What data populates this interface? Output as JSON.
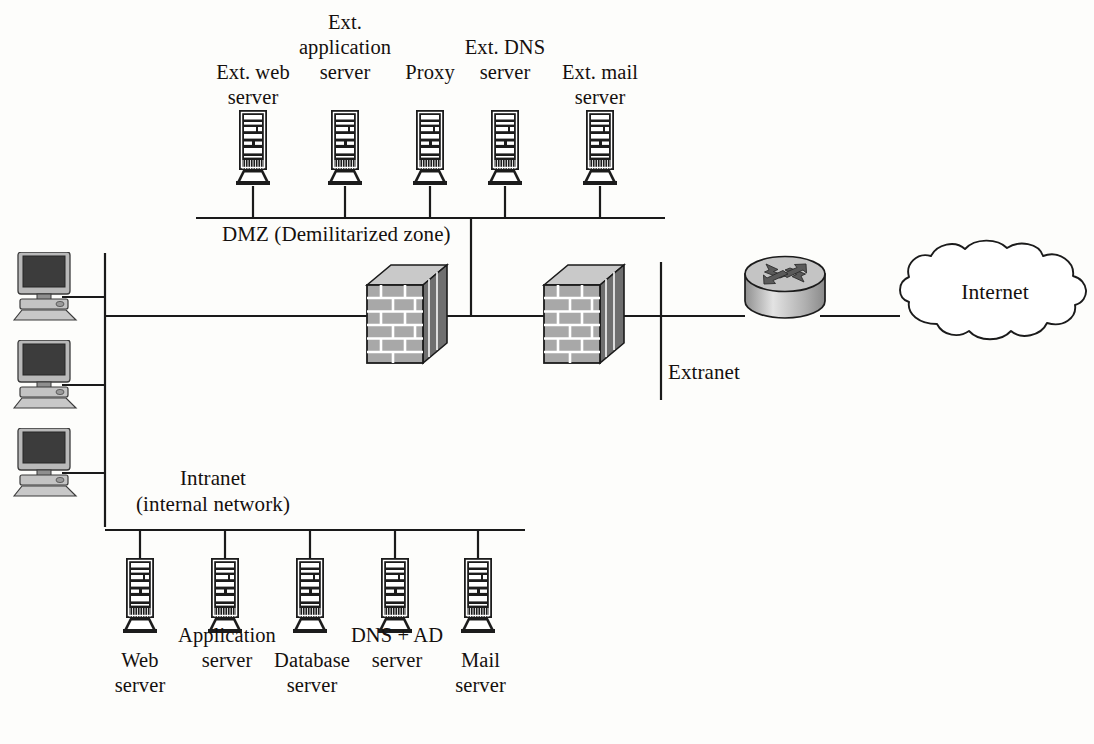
{
  "diagram": {
    "type": "network-topology",
    "background_color": "#fdfdfb",
    "line_color": "#1a1a1a",
    "zones": {
      "dmz": "DMZ (Demilitarized zone)",
      "intranet_line1": "Intranet",
      "intranet_line2": "(internal network)",
      "extranet": "Extranet",
      "internet": "Internet"
    },
    "dmz_servers": [
      {
        "id": "ext-web-server",
        "label": "Ext. web\nserver",
        "x": 253,
        "label_x": 253,
        "label_y": 60
      },
      {
        "id": "ext-application-server",
        "label": "Ext.\napplication\nserver",
        "x": 345,
        "label_x": 345,
        "label_y": 10
      },
      {
        "id": "proxy",
        "label": "Proxy",
        "x": 430,
        "label_x": 430,
        "label_y": 60
      },
      {
        "id": "ext-dns-server",
        "label": "Ext. DNS\nserver",
        "x": 505,
        "label_x": 505,
        "label_y": 35
      },
      {
        "id": "ext-mail-server",
        "label": "Ext. mail\nserver",
        "x": 600,
        "label_x": 600,
        "label_y": 60
      }
    ],
    "intranet_servers": [
      {
        "id": "web-server",
        "label": "Web\nserver",
        "x": 140,
        "label_x": 140,
        "label_y": 648
      },
      {
        "id": "application-server",
        "label": "Application\nserver",
        "x": 225,
        "label_x": 227,
        "label_y": 623
      },
      {
        "id": "database-server",
        "label": "Database\nserver",
        "x": 310,
        "label_x": 312,
        "label_y": 648
      },
      {
        "id": "dns-ad-server",
        "label": "DNS + AD\nserver",
        "x": 395,
        "label_x": 397,
        "label_y": 623
      },
      {
        "id": "mail-server",
        "label": "Mail\nserver",
        "x": 478,
        "label_x": 480,
        "label_y": 648
      }
    ],
    "workstations": [
      {
        "id": "workstation-1",
        "y": 252
      },
      {
        "id": "workstation-2",
        "y": 340
      },
      {
        "id": "workstation-3",
        "y": 428
      }
    ],
    "devices": [
      {
        "id": "firewall-inner",
        "type": "firewall",
        "x": 363,
        "y": 268
      },
      {
        "id": "firewall-outer",
        "type": "firewall",
        "x": 540,
        "y": 268
      },
      {
        "id": "router",
        "type": "router",
        "x": 742,
        "y": 252
      },
      {
        "id": "internet-cloud",
        "type": "cloud",
        "x": 890,
        "y": 245
      }
    ],
    "colors": {
      "server_body": "#1c1c1c",
      "server_highlight": "#ffffff",
      "firewall_face": "#a8a8a8",
      "firewall_mortar": "#ffffff",
      "firewall_top": "#c9c9c9",
      "firewall_side": "#555555",
      "router_top": "#c4c4c4",
      "router_arrow": "#5a5a5a",
      "monitor_screen": "#3a3a3a",
      "monitor_case": "#b9b9b9",
      "cloud_fill": "#ffffff",
      "line": "#1a1a1a"
    }
  }
}
